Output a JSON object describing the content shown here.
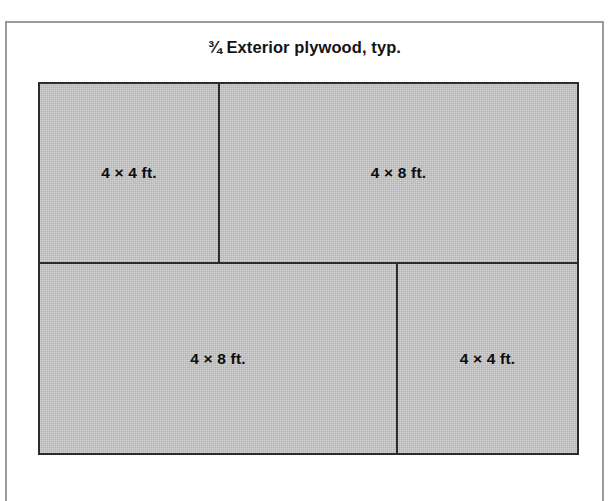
{
  "figure": {
    "title": "¾ Exterior plywood, typ.",
    "background_color": "#ffffff",
    "frame_border_color": "#9a9a9a",
    "panel_fill_color": "#bfbfbf",
    "panel_border_color": "#2b2b2b",
    "label_color": "#0d0d0d"
  },
  "diagram": {
    "type": "sheet-goods-cut-layout",
    "rows": [
      {
        "name": "top-row",
        "cells": [
          {
            "label": "4 × 4 ft.",
            "width_ft": 4,
            "height_ft": 4
          },
          {
            "label": "4 × 8 ft.",
            "width_ft": 8,
            "height_ft": 4
          }
        ]
      },
      {
        "name": "bottom-row",
        "cells": [
          {
            "label": "4 × 8 ft.",
            "width_ft": 8,
            "height_ft": 4
          },
          {
            "label": "4 × 4 ft.",
            "width_ft": 4,
            "height_ft": 4
          }
        ]
      }
    ]
  }
}
